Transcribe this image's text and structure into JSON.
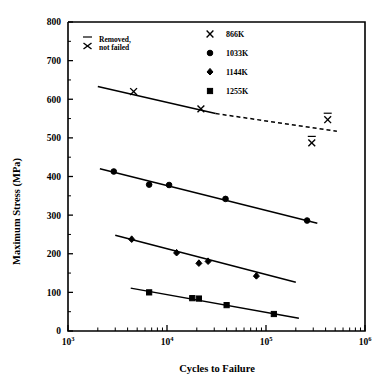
{
  "chart_data": {
    "type": "scatter",
    "title": "",
    "xlabel": "Cycles to Failure",
    "ylabel": "Maximum Stress (MPa)",
    "xscale": "log",
    "yscale": "linear",
    "xlim": [
      1000,
      1000000
    ],
    "ylim": [
      0,
      800
    ],
    "grid": false,
    "legend_position": "top-center-right",
    "x_tick_labels": [
      "10",
      "10",
      "10",
      "10"
    ],
    "x_tick_exponents": [
      "3",
      "4",
      "5",
      "6"
    ],
    "x_tick_values": [
      1000,
      10000,
      100000,
      1000000
    ],
    "y_tick_labels": [
      "0",
      "100",
      "200",
      "300",
      "400",
      "500",
      "600",
      "700",
      "800"
    ],
    "y_tick_values": [
      0,
      100,
      200,
      300,
      400,
      500,
      600,
      700,
      800
    ],
    "y_minor_ticks": [
      50,
      150,
      250,
      350,
      450,
      550,
      650,
      750
    ],
    "series": [
      {
        "name": "866K",
        "legend_label": "866K",
        "marker": "cross",
        "line_style": "solid-then-dashed",
        "x": [
          4600,
          22000
        ],
        "y": [
          620,
          575
        ],
        "fit_solid": {
          "x": [
            2000,
            31000
          ],
          "y": [
            633,
            563
          ]
        },
        "fit_dashed": {
          "x": [
            31000,
            520000
          ],
          "y": [
            563,
            517
          ]
        },
        "runouts": [
          {
            "x": 290000,
            "y": 487
          },
          {
            "x": 420000,
            "y": 547
          }
        ]
      },
      {
        "name": "1033K",
        "legend_label": "1033K",
        "marker": "circle",
        "line_style": "solid",
        "x": [
          2900,
          6600,
          10500,
          39000,
          260000
        ],
        "y": [
          413,
          379,
          378,
          342,
          286
        ],
        "fit_solid": {
          "x": [
            2100,
            330000
          ],
          "y": [
            420,
            279
          ]
        }
      },
      {
        "name": "1144K",
        "legend_label": "1144K",
        "marker": "diamond",
        "line_style": "solid",
        "x": [
          4400,
          12500,
          21000,
          26000,
          80000
        ],
        "y": [
          237,
          202,
          175,
          180,
          142
        ],
        "fit_solid": {
          "x": [
            3000,
            200000
          ],
          "y": [
            248,
            126
          ]
        }
      },
      {
        "name": "1255K",
        "legend_label": "1255K",
        "marker": "square",
        "line_style": "solid",
        "x": [
          6600,
          18000,
          21000,
          40000,
          120000
        ],
        "y": [
          100,
          85,
          84,
          67,
          44
        ],
        "fit_solid": {
          "x": [
            4300,
            215000
          ],
          "y": [
            111,
            33
          ]
        }
      }
    ],
    "annotations": [
      {
        "name": "removed-not-failed-note",
        "line1": "Removed,",
        "line2": "not failed",
        "symbol": "x-with-overbar"
      }
    ]
  },
  "legend": {
    "entries": [
      {
        "label": "866K",
        "marker": "cross"
      },
      {
        "label": "1033K",
        "marker": "circle"
      },
      {
        "label": "1144K",
        "marker": "diamond"
      },
      {
        "label": "1255K",
        "marker": "square"
      }
    ]
  },
  "note": {
    "line1": "Removed,",
    "line2": "not failed"
  },
  "axes": {
    "x_title": "Cycles to Failure",
    "y_title": "Maximum Stress (MPa)"
  },
  "colors": {
    "ink": "#000000",
    "background": "#ffffff"
  }
}
